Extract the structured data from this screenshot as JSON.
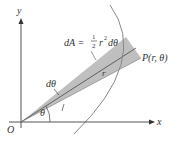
{
  "diagram": {
    "labels": {
      "y_axis": "y",
      "x_axis": "x",
      "origin": "O",
      "theta": "θ",
      "dtheta": "dθ",
      "r": "r",
      "point": "P(r, θ)",
      "formula_lhs": "dA =",
      "formula_num": "1",
      "formula_den": "2",
      "formula_rhs": "r",
      "formula_exp": "2",
      "formula_tail": "dθ"
    },
    "colors": {
      "axis": "#555555",
      "curve": "#888888",
      "sector_fill": "#b8b8b8",
      "text": "#333333"
    }
  }
}
